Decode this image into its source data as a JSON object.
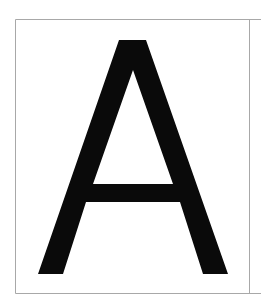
{
  "page": {
    "background": "#ffffff",
    "border_color": "#a8a8a8",
    "glyph_color": "#0a0a0a"
  },
  "glyph": {
    "character": "A",
    "label": "Letter A"
  }
}
